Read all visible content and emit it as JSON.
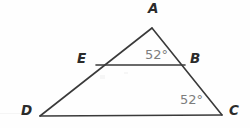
{
  "figure": {
    "type": "geometry-diagram",
    "background_color": "#fefefe",
    "stroke_color": "#3a3a3a",
    "label_color": "#2b2b2b",
    "angle_color": "#7d7d7d",
    "width": 250,
    "height": 128
  },
  "points": [
    {
      "id": "A",
      "label": "A",
      "x": 152,
      "y": 28,
      "label_x": 148,
      "label_y": 2
    },
    {
      "id": "B",
      "label": "B",
      "x": 185,
      "y": 65,
      "label_x": 190,
      "label_y": 52
    },
    {
      "id": "C",
      "label": "C",
      "x": 222,
      "y": 115,
      "label_x": 229,
      "label_y": 104
    },
    {
      "id": "D",
      "label": "D",
      "x": 40,
      "y": 116,
      "label_x": 21,
      "label_y": 104
    },
    {
      "id": "E",
      "label": "E",
      "x": 96,
      "y": 65,
      "label_x": 77,
      "label_y": 52
    }
  ],
  "segments": [
    {
      "id": "DA",
      "from": "D",
      "to": "A",
      "x1": 40,
      "y1": 116,
      "x2": 152,
      "y2": 28
    },
    {
      "id": "AC",
      "from": "A",
      "to": "C",
      "x1": 152,
      "y1": 28,
      "x2": 222,
      "y2": 115
    },
    {
      "id": "DC",
      "from": "D",
      "to": "C",
      "x1": 40,
      "y1": 116,
      "x2": 222,
      "y2": 115
    },
    {
      "id": "EB",
      "from": "E",
      "to": "B",
      "x1": 96,
      "y1": 65,
      "x2": 185,
      "y2": 65
    }
  ],
  "angles": [
    {
      "id": "angle-ABE",
      "vertex": "B",
      "value": "52",
      "degree_symbol": "°",
      "text": "52°",
      "x": 145,
      "y": 48
    },
    {
      "id": "angle-BCD",
      "vertex": "C",
      "value": "52",
      "degree_symbol": "°",
      "text": "52°",
      "x": 180,
      "y": 93
    }
  ]
}
